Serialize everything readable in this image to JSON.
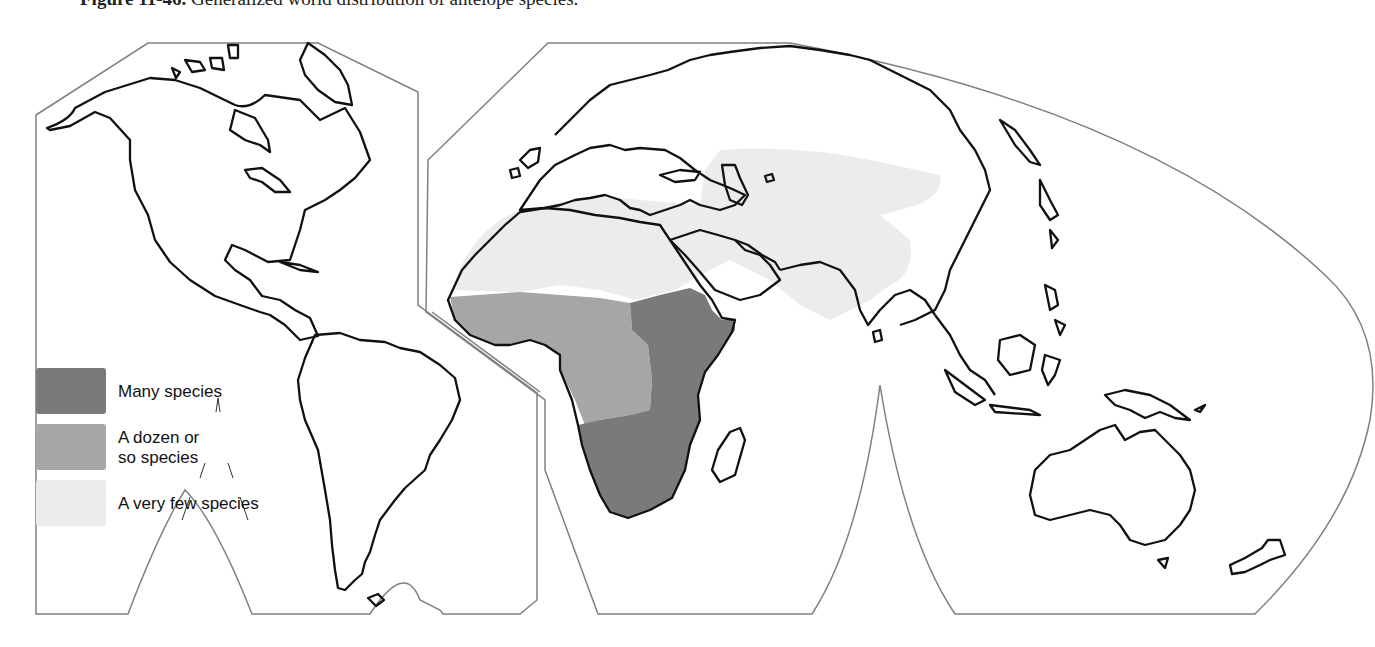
{
  "caption": {
    "figure_number": "Figure 11-46.",
    "text": "Generalized world distribution of antelope species."
  },
  "legend": {
    "items": [
      {
        "label": "Many species",
        "color": "#7a7a7a"
      },
      {
        "label_line1": "A dozen or",
        "label_line2": "so species",
        "color": "#a6a6a6"
      },
      {
        "label": "A very few species",
        "color": "#ececec"
      }
    ]
  },
  "map": {
    "projection": "interrupted (Goode-like) world projection, two lobes",
    "regions": [
      {
        "name": "sub-saharan-east-and-southern-africa",
        "category": "Many species"
      },
      {
        "name": "west-central-africa",
        "category": "A dozen or so species"
      },
      {
        "name": "north-africa-middle-east-central-asia-india",
        "category": "A very few species"
      }
    ],
    "colors": {
      "coast": "#111111",
      "frame": "#777777",
      "land": "#ffffff"
    }
  }
}
